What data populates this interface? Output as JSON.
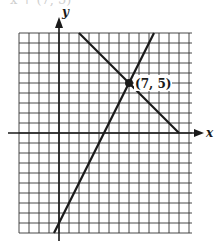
{
  "header": {
    "cut_text": "x + (7, 5)"
  },
  "chart_data": {
    "type": "line",
    "title": "",
    "xlabel": "x",
    "ylabel": "y",
    "xlim": [
      -4,
      13
    ],
    "ylim": [
      -10,
      10
    ],
    "grid": true,
    "grid_step": 1,
    "series": [
      {
        "name": "line-1",
        "equation": "y = 2x - 9",
        "points": [
          [
            -0.5,
            -10
          ],
          [
            9.5,
            10
          ]
        ]
      },
      {
        "name": "line-2",
        "equation": "y = -x + 12",
        "points": [
          [
            2,
            10
          ],
          [
            12,
            0
          ]
        ]
      }
    ],
    "annotations": [
      {
        "label": "(7, 5)",
        "x": 7,
        "y": 5,
        "marker": "filled-circle"
      }
    ]
  },
  "colors": {
    "ink": "#1a1a1a",
    "grid": "#333333",
    "background": "#ffffff"
  }
}
